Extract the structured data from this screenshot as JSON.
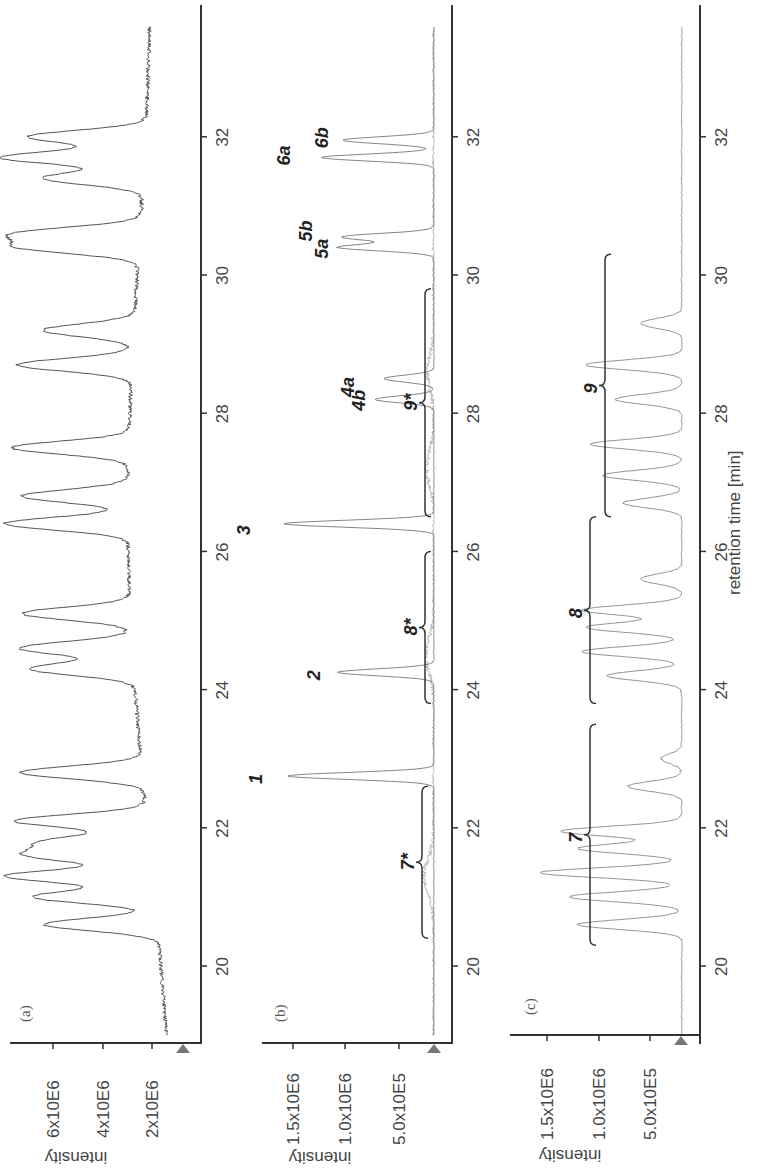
{
  "chart_data": [
    {
      "type": "line",
      "panel": "(a)",
      "title": "",
      "xlabel": "",
      "ylabel": "intensity",
      "x_ticks": [
        20,
        22,
        24,
        26,
        28,
        30,
        32
      ],
      "y_ticks": [
        "2x10E6",
        "4x10E6",
        "6x10E6"
      ],
      "xlim": [
        19.0,
        33.6
      ],
      "ylim": [
        0,
        7000000
      ],
      "orientation": "rotated 90deg counter-clockwise",
      "series": [
        {
          "name": "total ion chromatogram",
          "peaks": [
            {
              "x": 20.6,
              "y": 5200000
            },
            {
              "x": 21.0,
              "y": 5600000
            },
            {
              "x": 21.3,
              "y": 6800000
            },
            {
              "x": 21.6,
              "y": 5400000
            },
            {
              "x": 21.8,
              "y": 4600000
            },
            {
              "x": 22.1,
              "y": 6100000
            },
            {
              "x": 22.8,
              "y": 5600000
            },
            {
              "x": 24.3,
              "y": 4800000
            },
            {
              "x": 24.6,
              "y": 5200000
            },
            {
              "x": 25.1,
              "y": 5000000
            },
            {
              "x": 26.4,
              "y": 5700000
            },
            {
              "x": 26.8,
              "y": 4900000
            },
            {
              "x": 27.5,
              "y": 5400000
            },
            {
              "x": 28.7,
              "y": 5300000
            },
            {
              "x": 29.2,
              "y": 4200000
            },
            {
              "x": 30.4,
              "y": 5200000
            },
            {
              "x": 30.6,
              "y": 5500000
            },
            {
              "x": 31.4,
              "y": 4600000
            },
            {
              "x": 31.7,
              "y": 6600000
            },
            {
              "x": 32.0,
              "y": 5400000
            }
          ],
          "baseline": [
            {
              "x": 19.0,
              "y": 300000
            },
            {
              "x": 33.6,
              "y": 1300000
            }
          ]
        }
      ]
    },
    {
      "type": "line",
      "panel": "(b)",
      "xlabel": "",
      "ylabel": "intensity",
      "x_ticks": [
        20,
        22,
        24,
        26,
        28,
        30,
        32
      ],
      "y_ticks": [
        "5.0x10E5",
        "1.0x10E6",
        "1.5x10E6"
      ],
      "xlim": [
        19.0,
        33.6
      ],
      "ylim": [
        0,
        1800000
      ],
      "series": [
        {
          "name": "extracted ion chromatograms",
          "peaks": [
            {
              "x": 22.75,
              "y": 1750000,
              "label": "1"
            },
            {
              "x": 24.25,
              "y": 1150000,
              "label": "2"
            },
            {
              "x": 26.4,
              "y": 1800000,
              "label": "3"
            },
            {
              "x": 28.2,
              "y": 700000,
              "label": "4a"
            },
            {
              "x": 28.5,
              "y": 600000,
              "label": "4b"
            },
            {
              "x": 30.4,
              "y": 1150000,
              "label": "5a"
            },
            {
              "x": 30.55,
              "y": 1100000,
              "label": "5b"
            },
            {
              "x": 31.7,
              "y": 1350000,
              "label": "6a"
            },
            {
              "x": 31.95,
              "y": 1100000,
              "label": "6b"
            }
          ]
        }
      ],
      "annotations": [
        {
          "label": "7*",
          "range": [
            20.4,
            22.6
          ]
        },
        {
          "label": "8*",
          "range": [
            23.8,
            26.0
          ]
        },
        {
          "label": "9*",
          "range": [
            26.5,
            29.8
          ]
        }
      ]
    },
    {
      "type": "line",
      "panel": "(c)",
      "xlabel": "retention time [min]",
      "ylabel": "intensity",
      "x_ticks": [
        20,
        22,
        24,
        26,
        28,
        30,
        32
      ],
      "y_ticks": [
        "5.0x10E5",
        "1.0x10E6",
        "1.5x10E6"
      ],
      "xlim": [
        19.0,
        33.6
      ],
      "ylim": [
        0,
        1800000
      ],
      "series": [
        {
          "name": "chromatogram",
          "peaks": [
            {
              "x": 20.6,
              "y": 1250000
            },
            {
              "x": 21.0,
              "y": 1350000
            },
            {
              "x": 21.35,
              "y": 1700000
            },
            {
              "x": 21.7,
              "y": 1250000
            },
            {
              "x": 21.95,
              "y": 1450000
            },
            {
              "x": 22.6,
              "y": 650000
            },
            {
              "x": 23.0,
              "y": 250000
            },
            {
              "x": 24.2,
              "y": 900000
            },
            {
              "x": 24.55,
              "y": 1200000
            },
            {
              "x": 24.9,
              "y": 1150000
            },
            {
              "x": 25.15,
              "y": 1200000
            },
            {
              "x": 25.6,
              "y": 500000
            },
            {
              "x": 26.7,
              "y": 700000
            },
            {
              "x": 27.1,
              "y": 950000
            },
            {
              "x": 27.55,
              "y": 1100000
            },
            {
              "x": 28.2,
              "y": 800000
            },
            {
              "x": 28.7,
              "y": 1150000
            },
            {
              "x": 29.3,
              "y": 500000
            }
          ]
        }
      ],
      "annotations": [
        {
          "label": "7",
          "range": [
            20.3,
            23.5
          ]
        },
        {
          "label": "8",
          "range": [
            23.8,
            26.5
          ]
        },
        {
          "label": "9",
          "range": [
            26.5,
            30.3
          ]
        }
      ]
    }
  ],
  "panels": {
    "a": {
      "label": "(a)",
      "y_title": "intensity",
      "y_ticks": [
        "6x10E6",
        "4x10E6",
        "2x10E6"
      ]
    },
    "b": {
      "label": "(b)",
      "y_title": "intensity",
      "y_ticks": [
        "1.5x10E6",
        "1.0x10E6",
        "5.0x10E5"
      ]
    },
    "c": {
      "label": "(c)",
      "y_title": "intensity",
      "y_ticks": [
        "1.5x10E6",
        "1.0x10E6",
        "5.0x10E5"
      ]
    }
  },
  "x_axis": {
    "title": "retention time [min]",
    "ticks": [
      "20",
      "22",
      "24",
      "26",
      "28",
      "30",
      "32"
    ]
  },
  "peak_labels_b": [
    "1",
    "2",
    "3",
    "4a",
    "4b",
    "5a",
    "5b",
    "6a",
    "6b",
    "7*",
    "8*",
    "9*"
  ],
  "peak_labels_c": [
    "7",
    "8",
    "9"
  ]
}
